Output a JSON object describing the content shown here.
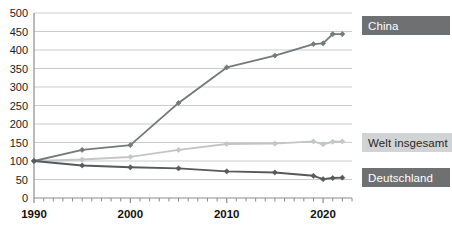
{
  "chart_data": {
    "type": "line",
    "title": "",
    "subtitle": "",
    "xlabel": "",
    "ylabel": "",
    "xlim": [
      1990,
      2023
    ],
    "ylim": [
      0,
      500
    ],
    "grid": true,
    "legend_position": "right",
    "ytick_labels": [
      "500",
      "450",
      "400",
      "350",
      "300",
      "250",
      "200",
      "150",
      "100",
      "50",
      "0"
    ],
    "ytick_values": [
      500,
      450,
      400,
      350,
      300,
      250,
      200,
      150,
      100,
      50,
      0
    ],
    "xtick_labels": [
      "1990",
      "2000",
      "2010",
      "2020"
    ],
    "xtick_values": [
      1990,
      2000,
      2010,
      2020
    ],
    "x_minor_tick_step": 1,
    "x": [
      1990,
      1995,
      2000,
      2005,
      2010,
      2015,
      2019,
      2020,
      2021,
      2022
    ],
    "series": [
      {
        "name": "China",
        "color": "#76797b",
        "values": [
          100,
          130,
          143,
          257,
          353,
          385,
          416,
          418,
          443,
          443
        ]
      },
      {
        "name": "Welt insgesamt",
        "color": "#c3c5c7",
        "values": [
          100,
          104,
          111,
          130,
          146,
          147,
          153,
          145,
          152,
          153
        ]
      },
      {
        "name": "Deutschland",
        "color": "#58595b",
        "values": [
          100,
          88,
          83,
          80,
          72,
          69,
          60,
          51,
          54,
          55
        ]
      }
    ]
  },
  "legend": {
    "china": {
      "label": "China",
      "background": "#6e7072",
      "text_color": "#ffffff"
    },
    "welt": {
      "label": "Welt insgesamt",
      "background": "#d2d3d4",
      "text_color": "#262626"
    },
    "deutschland": {
      "label": "Deutschland",
      "background": "#6e7072",
      "text_color": "#ffffff"
    }
  },
  "axes": {
    "axis_color": "#8a8c8e",
    "grid_color": "#c9cbcd",
    "tick_text_color": "#1a1a1a"
  }
}
